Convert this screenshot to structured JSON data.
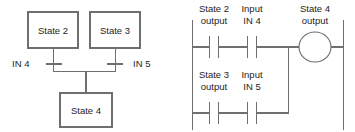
{
  "figure": {
    "title": "",
    "state_diagram": {
      "name": "state-transition-diagram",
      "boxes": [
        {
          "id": "state2",
          "label": "State 2",
          "x": 28,
          "y": 12,
          "w": 50,
          "h": 36
        },
        {
          "id": "state3",
          "label": "State 3",
          "x": 90,
          "y": 12,
          "w": 50,
          "h": 36
        },
        {
          "id": "state4",
          "label": "State 4",
          "x": 60,
          "y": 93,
          "w": 52,
          "h": 34
        }
      ],
      "transitions": [
        {
          "id": "t-in4",
          "label": "IN 4",
          "bar_x1": 46,
          "bar_x2": 62,
          "bar_y": 64,
          "label_x": 12,
          "label_y": 67
        },
        {
          "id": "t-in5",
          "label": "IN 5",
          "bar_x1": 107,
          "bar_x2": 123,
          "bar_y": 64,
          "label_x": 133,
          "label_y": 67
        }
      ]
    },
    "ladder_diagram": {
      "name": "ladder-logic-diagram",
      "left_rail_x": 192,
      "right_rail_x": 343,
      "rail_top_y": 20,
      "rail_bottom_y": 130,
      "branch_x": 288,
      "rungs": [
        {
          "id": "rung-1",
          "y": 47,
          "contacts": [
            {
              "id": "contact-state2-output",
              "label_line1": "State 2",
              "label_line2": "output",
              "x": 214,
              "label_y1": 12,
              "label_y2": 24
            },
            {
              "id": "contact-input-in4",
              "label_line1": "Input",
              "label_line2": "IN 4",
              "x": 252,
              "label_y1": 12,
              "label_y2": 24
            }
          ]
        },
        {
          "id": "rung-2",
          "y": 113,
          "contacts": [
            {
              "id": "contact-state3-output",
              "label_line1": "State 3",
              "label_line2": "output",
              "x": 214,
              "label_y1": 78,
              "label_y2": 90
            },
            {
              "id": "contact-input-in5",
              "label_line1": "Input",
              "label_line2": "IN 5",
              "x": 252,
              "label_y1": 78,
              "label_y2": 90
            }
          ]
        }
      ],
      "coil": {
        "id": "coil-state4-output",
        "label_line1": "State 4",
        "label_line2": "output",
        "cx": 315,
        "cy": 47,
        "rx": 16,
        "ry": 15,
        "label_x": 315,
        "label_y1": 12,
        "label_y2": 24
      }
    },
    "colors": {
      "line": "#6f6f6f",
      "text": "#1d1d1d",
      "background": "#ffffff"
    }
  }
}
